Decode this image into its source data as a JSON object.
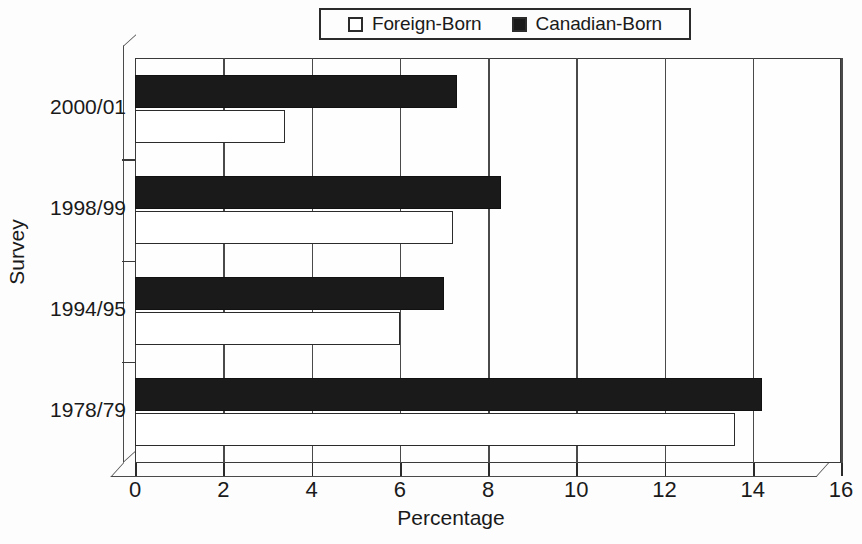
{
  "chart_data": {
    "type": "bar",
    "orientation": "horizontal",
    "title": "",
    "xlabel": "Percentage",
    "ylabel": "Survey",
    "xlim": [
      0,
      16
    ],
    "xticks": [
      0,
      2,
      4,
      6,
      8,
      10,
      12,
      14,
      16
    ],
    "xticklabels": [
      "0",
      "2",
      "4",
      "6",
      "8",
      "10",
      "12",
      "14",
      "16"
    ],
    "grid": true,
    "grid_axis": "x",
    "legend_position": "top-center",
    "categories": [
      "2000/01",
      "1998/99",
      "1994/95",
      "1978/79"
    ],
    "series": [
      {
        "name": "Foreign-Born",
        "color": "#ffffff",
        "edgecolor": "#2b2b2b",
        "values": [
          3.4,
          7.2,
          6.0,
          13.6
        ]
      },
      {
        "name": "Canadian-Born",
        "color": "#1a1a1a",
        "edgecolor": "#111111",
        "values": [
          7.3,
          8.3,
          7.0,
          14.2
        ]
      }
    ]
  },
  "legend": {
    "entries": [
      {
        "label": "Foreign-Born",
        "swatch": "open-square-icon"
      },
      {
        "label": "Canadian-Born",
        "swatch": "filled-square-icon"
      }
    ]
  },
  "axes": {
    "x_title": "Percentage",
    "y_title": "Survey"
  },
  "colors": {
    "background": "#fdfdfd",
    "plot_background": "#fefefe",
    "axis": "#2b2b2b",
    "gridline": "#4a4a4a",
    "series_foreign_born": "#ffffff",
    "series_canadian_born": "#1a1a1a"
  }
}
